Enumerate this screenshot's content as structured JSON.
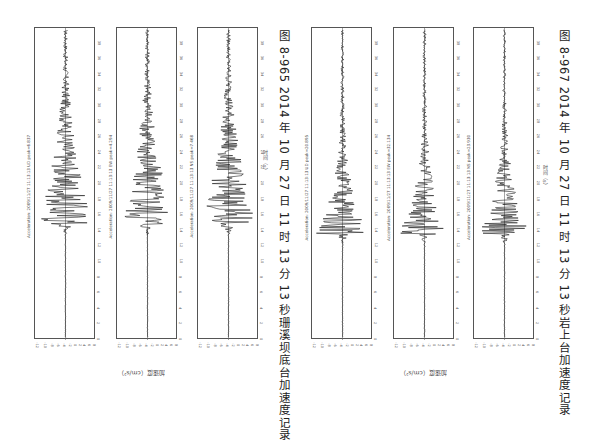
{
  "figures": [
    {
      "caption": "图 8-965   2014 年 10 月 27 日 11 时 13 分 13 秒珊溪坝底台加速度记录",
      "y_axis_label": "加速度（cm/s²）",
      "x_axis_label": "时间（s）",
      "panels": [
        {
          "annotation": "Acceleration: 2009/11/27 11:13:13 UD  peak=6.837",
          "shape": "broad"
        },
        {
          "annotation": "Acceleration: 2009/11/27 11:13:13 EW  peak=4.294",
          "shape": "broad"
        },
        {
          "annotation": "Acceleration: 2009/11/27 11:13:13 NS  peak=7.468",
          "shape": "broad"
        }
      ]
    },
    {
      "caption": "图 8-967   2014 年 10 月 27 日 11 时 13 分 13 秒岩上台加速度记录",
      "y_axis_label": "加速度（cm/s²）",
      "x_axis_label": "时间（s）",
      "panels": [
        {
          "annotation": "Acceleration: 2009/11/27 11:13:13 UD  peak=20.895",
          "shape": "spike"
        },
        {
          "annotation": "Acceleration: 2009/11/27 11:13:13 EW  peak=32.134",
          "shape": "spike"
        },
        {
          "annotation": "Acceleration: 2009/11/27 11:13:13 NS  peak=23.930",
          "shape": "spike"
        }
      ]
    }
  ],
  "time_ticks": [
    "0",
    "2",
    "4",
    "6",
    "8",
    "10",
    "12",
    "14",
    "16",
    "18",
    "20",
    "22",
    "24",
    "26",
    "28",
    "30",
    "32",
    "34",
    "36",
    "38"
  ],
  "amp_ticks": [
    "-14",
    "-12",
    "-10",
    "-8",
    "-6",
    "-4",
    "-2",
    "0",
    "2",
    "4",
    "6",
    "8",
    "10"
  ]
}
